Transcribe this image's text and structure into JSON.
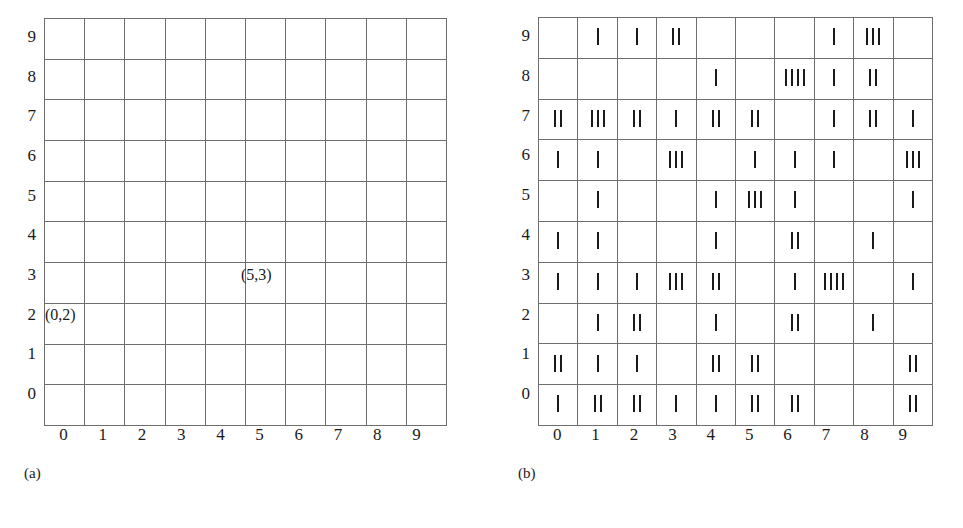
{
  "panels": [
    {
      "id": "a",
      "caption": "(a)",
      "x_labels": [
        "0",
        "1",
        "2",
        "3",
        "4",
        "5",
        "6",
        "7",
        "8",
        "9"
      ],
      "y_labels": [
        "9",
        "8",
        "7",
        "6",
        "5",
        "4",
        "3",
        "2",
        "1",
        "0"
      ],
      "annotations": [
        {
          "text": "(0,2)",
          "col": 0,
          "row": 2
        },
        {
          "text": "(5,3)",
          "col": 5,
          "row": 3
        }
      ]
    },
    {
      "id": "b",
      "caption": "(b)",
      "x_labels": [
        "0",
        "1",
        "2",
        "3",
        "4",
        "5",
        "6",
        "7",
        "8",
        "9"
      ],
      "y_labels": [
        "9",
        "8",
        "7",
        "6",
        "5",
        "4",
        "3",
        "2",
        "1",
        "0"
      ],
      "tally_counts_top_to_bottom": [
        [
          0,
          1,
          1,
          2,
          0,
          0,
          0,
          1,
          3,
          0
        ],
        [
          0,
          0,
          0,
          0,
          1,
          0,
          4,
          1,
          2,
          0
        ],
        [
          2,
          3,
          2,
          1,
          2,
          2,
          0,
          1,
          2,
          1
        ],
        [
          1,
          1,
          0,
          3,
          0,
          1,
          1,
          1,
          0,
          3
        ],
        [
          0,
          1,
          0,
          0,
          1,
          3,
          1,
          0,
          0,
          1
        ],
        [
          1,
          1,
          0,
          0,
          1,
          0,
          2,
          0,
          1,
          0
        ],
        [
          1,
          1,
          1,
          3,
          2,
          0,
          1,
          4,
          0,
          1
        ],
        [
          0,
          1,
          2,
          0,
          1,
          0,
          2,
          0,
          1,
          0
        ],
        [
          2,
          1,
          1,
          0,
          2,
          2,
          0,
          0,
          0,
          2
        ],
        [
          1,
          2,
          2,
          1,
          1,
          2,
          2,
          0,
          0,
          2
        ]
      ]
    }
  ],
  "chart_data": {
    "type": "heatmap",
    "title": "",
    "xlabel": "",
    "ylabel": "",
    "x": [
      0,
      1,
      2,
      3,
      4,
      5,
      6,
      7,
      8,
      9
    ],
    "y": [
      9,
      8,
      7,
      6,
      5,
      4,
      3,
      2,
      1,
      0
    ],
    "values": [
      [
        0,
        1,
        1,
        2,
        0,
        0,
        0,
        1,
        3,
        0
      ],
      [
        0,
        0,
        0,
        0,
        1,
        0,
        4,
        1,
        2,
        0
      ],
      [
        2,
        3,
        2,
        1,
        2,
        2,
        0,
        1,
        2,
        1
      ],
      [
        1,
        1,
        0,
        3,
        0,
        1,
        1,
        1,
        0,
        3
      ],
      [
        0,
        1,
        0,
        0,
        1,
        3,
        1,
        0,
        0,
        1
      ],
      [
        1,
        1,
        0,
        0,
        1,
        0,
        2,
        0,
        1,
        0
      ],
      [
        1,
        1,
        1,
        3,
        2,
        0,
        1,
        4,
        0,
        1
      ],
      [
        0,
        1,
        2,
        0,
        1,
        0,
        2,
        0,
        1,
        0
      ],
      [
        2,
        1,
        1,
        0,
        2,
        2,
        0,
        0,
        0,
        2
      ],
      [
        1,
        2,
        2,
        1,
        1,
        2,
        2,
        0,
        0,
        2
      ]
    ],
    "panel_a_annotations": [
      "(0,2)",
      "(5,3)"
    ],
    "captions": [
      "(a)",
      "(b)"
    ]
  }
}
